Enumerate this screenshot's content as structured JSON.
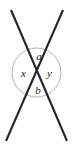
{
  "figure": {
    "kind": "vertical-angles-diagram",
    "width": 147,
    "background_color": "#ffffff",
    "colors": {
      "line": "#262626",
      "circle": "#a8a8a8",
      "label": "#1a1a1a"
    },
    "circle": {
      "center_x": 36.5,
      "center_y": 72.5,
      "radius": 24.5,
      "stroke_width": 0.9
    },
    "lines": [
      {
        "name": "line-top-left-to-bottom-right",
        "x1": 11,
        "y1": 10,
        "x2": 67,
        "y2": 141,
        "stroke_width": 2.1
      },
      {
        "name": "line-top-right-to-bottom-left",
        "x1": 63,
        "y1": 10,
        "x2": 6,
        "y2": 141,
        "stroke_width": 2.1
      }
    ],
    "intersection": {
      "x": 36.5,
      "y": 72.5
    },
    "labels": [
      {
        "id": "a",
        "text": "a",
        "x": 39,
        "y": 55.5,
        "position": "top-angle"
      },
      {
        "id": "x",
        "text": "x",
        "x": 23.5,
        "y": 72.5,
        "position": "left-angle"
      },
      {
        "id": "y",
        "text": "y",
        "x": 49.5,
        "y": 72.5,
        "position": "right-angle"
      },
      {
        "id": "b",
        "text": "b",
        "x": 38,
        "y": 90,
        "position": "bottom-angle"
      }
    ]
  }
}
